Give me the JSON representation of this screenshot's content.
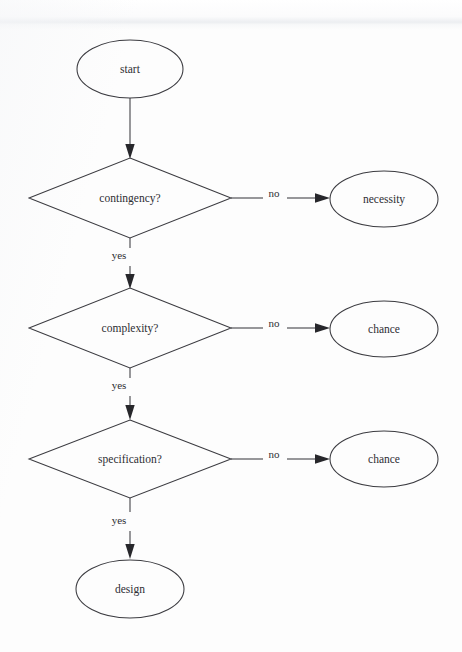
{
  "diagram": {
    "type": "flowchart",
    "background_color": "#fdfdfd",
    "line_color": "#3b3b40",
    "text_color": "#2e2e33"
  },
  "nodes": {
    "start": {
      "label": "start",
      "shape": "ellipse",
      "cx": 130,
      "cy": 69,
      "rx": 53,
      "ry": 29
    },
    "contingency": {
      "label": "contingency?",
      "shape": "diamond",
      "cx": 130,
      "cy": 198,
      "rx": 101,
      "ry": 40
    },
    "necessity": {
      "label": "necessity",
      "shape": "ellipse",
      "cx": 384,
      "cy": 199,
      "rx": 54,
      "ry": 28
    },
    "complexity": {
      "label": "complexity?",
      "shape": "diamond",
      "cx": 130,
      "cy": 328,
      "rx": 101,
      "ry": 40
    },
    "chance_1": {
      "label": "chance",
      "shape": "ellipse",
      "cx": 384,
      "cy": 329,
      "rx": 54,
      "ry": 28
    },
    "specification": {
      "label": "specification?",
      "shape": "diamond",
      "cx": 130,
      "cy": 459,
      "rx": 101,
      "ry": 39
    },
    "chance_2": {
      "label": "chance",
      "shape": "ellipse",
      "cx": 384,
      "cy": 459,
      "rx": 54,
      "ry": 28
    },
    "design": {
      "label": "design",
      "shape": "ellipse",
      "cx": 130,
      "cy": 589,
      "rx": 54,
      "ry": 29
    }
  },
  "edges": [
    {
      "id": "start-to-contingency",
      "label": "",
      "from": "start",
      "to": "contingency"
    },
    {
      "id": "contingency-no-necessity",
      "label": "no",
      "from": "contingency",
      "to": "necessity",
      "label_x": 274,
      "label_y": 194
    },
    {
      "id": "contingency-yes-complexity",
      "label": "yes",
      "from": "contingency",
      "to": "complexity",
      "label_x": 119,
      "label_y": 256
    },
    {
      "id": "complexity-no-chance",
      "label": "no",
      "from": "complexity",
      "to": "chance_1",
      "label_x": 274,
      "label_y": 324
    },
    {
      "id": "complexity-yes-specification",
      "label": "yes",
      "from": "complexity",
      "to": "specification",
      "label_x": 119,
      "label_y": 386
    },
    {
      "id": "specification-no-chance",
      "label": "no",
      "from": "specification",
      "to": "chance_2",
      "label_x": 274,
      "label_y": 455
    },
    {
      "id": "specification-yes-design",
      "label": "yes",
      "from": "specification",
      "to": "design",
      "label_x": 119,
      "label_y": 521
    }
  ]
}
